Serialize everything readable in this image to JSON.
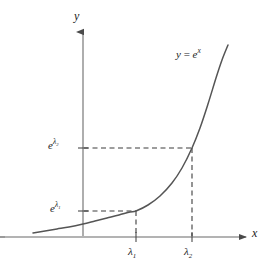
{
  "figure": {
    "kind": "math-plot",
    "background_color": "#ffffff",
    "axis_color": "#808080",
    "curve_color": "#555555",
    "dash_color": "#3c3c3c",
    "text_color": "#1a1a1a"
  },
  "axes": {
    "y_axis_label": "y",
    "x_axis_label": "x",
    "y_axis_x_px": 83,
    "x_axis_y_px": 237,
    "y_axis_top_px": 30,
    "x_axis_right_px": 248,
    "x_axis_left_px": 5,
    "show_grid": false,
    "show_arrowheads": true
  },
  "curve": {
    "label_parts": {
      "lhs": "y",
      "equals": "=",
      "base": "e",
      "exponent": "x"
    },
    "label_plain": "y = e^x",
    "function": "exponential"
  },
  "ticks": {
    "x": [
      {
        "name": "lambda-1",
        "base": "λ",
        "sub": "1",
        "plain": "λ₁",
        "px": 136
      },
      {
        "name": "lambda-2",
        "base": "λ",
        "sub": "2",
        "plain": "λ₂",
        "px": 192
      }
    ],
    "y": [
      {
        "name": "e-lambda-1",
        "base": "e",
        "exp_base": "λ",
        "exp_sub": "1",
        "plain": "e^λ₁",
        "px": 211
      },
      {
        "name": "e-lambda-2",
        "base": "e",
        "exp_base": "λ",
        "exp_sub": "2",
        "plain": "e^λ₂",
        "px": 148
      }
    ]
  },
  "chart_data": {
    "type": "line",
    "title": "",
    "xlabel": "x",
    "ylabel": "y",
    "series": [
      {
        "name": "y = e^x",
        "points_px": [
          [
            33,
            233
          ],
          [
            45,
            231
          ],
          [
            57,
            229
          ],
          [
            69,
            227
          ],
          [
            83,
            224
          ],
          [
            95,
            221
          ],
          [
            107,
            218
          ],
          [
            119,
            215
          ],
          [
            130,
            212
          ],
          [
            136,
            211
          ],
          [
            148,
            205
          ],
          [
            160,
            196
          ],
          [
            172,
            183
          ],
          [
            182,
            168
          ],
          [
            192,
            148
          ],
          [
            200,
            128
          ],
          [
            208,
            104
          ],
          [
            216,
            78
          ],
          [
            222,
            60
          ],
          [
            228,
            45
          ]
        ]
      }
    ],
    "annotations": [
      {
        "name": "dashed-guide-lambda-1",
        "from_px": [
          83,
          211
        ],
        "to_px": [
          136,
          211
        ],
        "orientation": "horizontal",
        "style": "dashed"
      },
      {
        "name": "dashed-guide-lambda-1-vertical",
        "from_px": [
          136,
          211
        ],
        "to_px": [
          136,
          237
        ],
        "orientation": "vertical",
        "style": "dashed"
      },
      {
        "name": "dashed-guide-lambda-2",
        "from_px": [
          83,
          148
        ],
        "to_px": [
          192,
          148
        ],
        "orientation": "horizontal",
        "style": "dashed"
      },
      {
        "name": "dashed-guide-lambda-2-vertical",
        "from_px": [
          192,
          148
        ],
        "to_px": [
          192,
          237
        ],
        "orientation": "vertical",
        "style": "dashed"
      }
    ],
    "xtick_labels": [
      "λ₁",
      "λ₂"
    ],
    "ytick_labels": [
      "e^λ₁",
      "e^λ₂"
    ],
    "legend": []
  }
}
